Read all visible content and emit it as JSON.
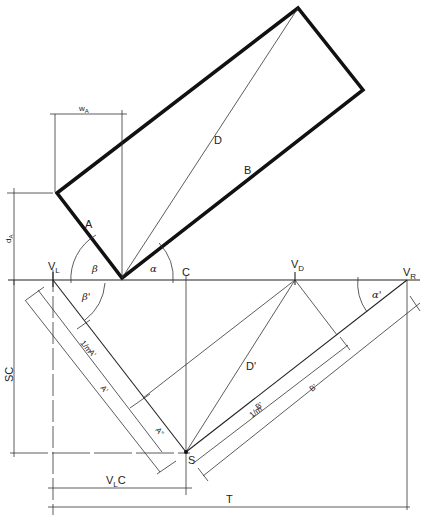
{
  "diagram": {
    "type": "two-point perspective construction",
    "labels": {
      "w_a": "w",
      "w_a_sub": "A",
      "d_a": "d",
      "d_a_sub": "A",
      "A": "A",
      "B": "B",
      "D": "D",
      "alpha": "α",
      "beta": "β",
      "beta_prime": "β'",
      "alpha_prime": "α'",
      "C": "C",
      "VL": "V",
      "VL_sub": "L",
      "VD": "V",
      "VD_sub": "D",
      "VR": "V",
      "VR_sub": "R",
      "SC": "SC",
      "A_prime_scaled": "A'",
      "A_prime": "A'",
      "A_double_prime": "A\"",
      "D_prime": "D'",
      "B_prime_scaled": "B'",
      "B_prime": "B'",
      "S": "S",
      "VLC": "V",
      "VLC_sub": "L",
      "VLC_tail": "C",
      "T": "T",
      "scale_fraction": "1/m"
    }
  }
}
